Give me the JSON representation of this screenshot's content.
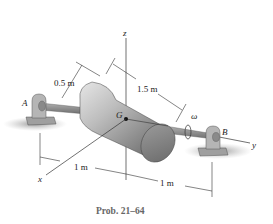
{
  "figure": {
    "caption": "Prob. 21–64",
    "points": {
      "A": "A",
      "B": "B",
      "G": "G"
    },
    "axes": {
      "x": "x",
      "y": "y",
      "z": "z"
    },
    "angular_velocity": "ω",
    "dimensions": {
      "radius": "0.5 m",
      "length": "1.5 m",
      "a_to_origin": "1 m",
      "origin_to_b": "1 m"
    },
    "colors": {
      "cylinder_light": "#d9d9d9",
      "cylinder_dark": "#6f6f6f",
      "shadow": "#9a9a9a",
      "lines": "#333333",
      "caption": "#666666"
    }
  }
}
